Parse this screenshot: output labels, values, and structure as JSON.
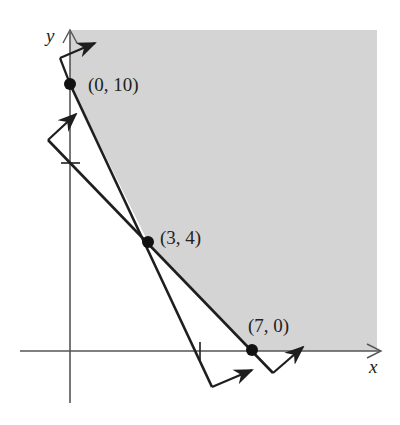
{
  "diagram": {
    "type": "feasible-region",
    "axes": {
      "x_label": "x",
      "y_label": "y"
    },
    "colors": {
      "shaded_region": "#d4d4d4",
      "lines": "#1e1e1e",
      "background": "#ffffff"
    },
    "points": [
      {
        "label": "(0, 10)",
        "x": 0,
        "y": 10
      },
      {
        "label": "(3, 4)",
        "x": 3,
        "y": 4
      },
      {
        "label": "(7, 0)",
        "x": 7,
        "y": 0
      }
    ],
    "ticks": [
      {
        "axis": "x",
        "value": 5
      },
      {
        "axis": "y",
        "value": 7
      }
    ],
    "lines": [
      {
        "name": "line-through-0-10-and-3-4",
        "x_intercept": 5,
        "y_intercept": 10
      },
      {
        "name": "line-through-3-4-and-7-0",
        "x_intercept": 7,
        "y_intercept": 7
      }
    ]
  }
}
